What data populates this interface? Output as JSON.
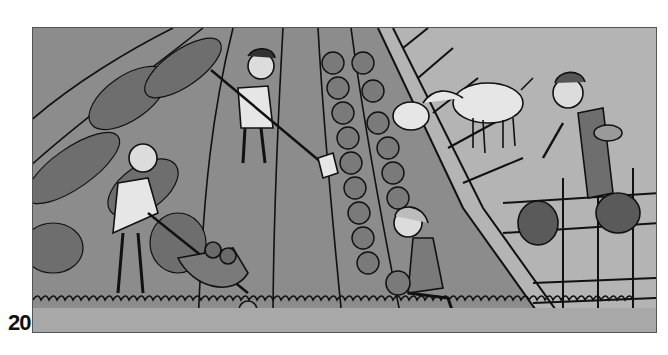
{
  "page": {
    "number": "20"
  },
  "illustration": {
    "description": "Black-and-white cartoon of a vegetable garden: a boy digging with a shovel, a boy pushing a wheelbarrow of cabbages, a girl harvesting cabbages from a row, a goat behind a fence, and a farmer scattering feed to two chickens.",
    "palette": {
      "field": "#8c8c8c",
      "pasture": "#b4b4b4",
      "ink": "#111111",
      "white_fill": "#e6e6e6",
      "dark_fill": "#5a5a5a"
    },
    "elements": [
      {
        "name": "crop-rows",
        "kind": "scenery"
      },
      {
        "name": "boy-with-shovel",
        "kind": "character"
      },
      {
        "name": "boy-with-wheelbarrow",
        "kind": "character"
      },
      {
        "name": "cabbage-rows",
        "kind": "scenery"
      },
      {
        "name": "girl-picking-cabbage",
        "kind": "character"
      },
      {
        "name": "goat",
        "kind": "animal"
      },
      {
        "name": "fence",
        "kind": "scenery"
      },
      {
        "name": "farmer-feeding-chickens",
        "kind": "character"
      },
      {
        "name": "chicken-left",
        "kind": "animal"
      },
      {
        "name": "chicken-right",
        "kind": "animal"
      },
      {
        "name": "grass-border",
        "kind": "scenery"
      }
    ]
  }
}
